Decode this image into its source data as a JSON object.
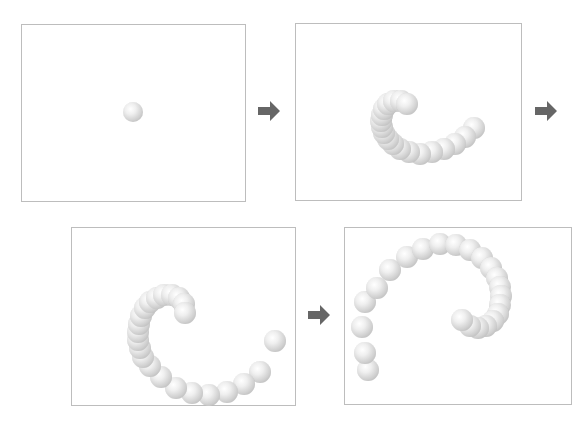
{
  "diagram": {
    "colors": {
      "panel_border": "#bdbdbd",
      "arrow": "#666666",
      "ball_light": "#ffffff",
      "ball_dark": "#a9a9a9"
    },
    "panels": [
      {
        "name": "frame-1",
        "x": 21,
        "y": 24,
        "w": 225,
        "h": 178,
        "balls": [
          [
            133,
            112,
            10
          ]
        ]
      },
      {
        "name": "frame-2",
        "x": 295,
        "y": 23,
        "w": 227,
        "h": 178,
        "balls": [
          [
            407,
            104,
            11
          ],
          [
            401,
            101,
            11
          ],
          [
            394,
            101,
            11
          ],
          [
            388,
            104,
            11
          ],
          [
            384,
            109,
            11
          ],
          [
            382,
            115,
            11
          ],
          [
            381,
            121,
            11
          ],
          [
            382,
            127,
            11
          ],
          [
            384,
            133,
            11
          ],
          [
            388,
            139,
            11
          ],
          [
            393,
            144,
            11
          ],
          [
            400,
            149,
            11
          ],
          [
            409,
            152,
            11
          ],
          [
            420,
            154,
            11
          ],
          [
            432,
            152,
            11
          ],
          [
            444,
            149,
            11
          ],
          [
            455,
            144,
            11
          ],
          [
            465,
            137,
            11
          ],
          [
            474,
            128,
            11
          ]
        ]
      },
      {
        "name": "frame-3",
        "x": 71,
        "y": 227,
        "w": 225,
        "h": 179,
        "balls": [
          [
            185,
            313,
            11
          ],
          [
            184,
            304,
            11
          ],
          [
            179,
            298,
            11
          ],
          [
            172,
            295,
            11
          ],
          [
            164,
            295,
            11
          ],
          [
            157,
            298,
            11
          ],
          [
            150,
            302,
            11
          ],
          [
            145,
            308,
            11
          ],
          [
            141,
            316,
            11
          ],
          [
            139,
            324,
            11
          ],
          [
            138,
            332,
            11
          ],
          [
            138,
            340,
            11
          ],
          [
            140,
            348,
            11
          ],
          [
            143,
            357,
            11
          ],
          [
            150,
            366,
            11
          ],
          [
            161,
            377,
            11
          ],
          [
            176,
            388,
            11
          ],
          [
            192,
            393,
            11
          ],
          [
            209,
            395,
            11
          ],
          [
            227,
            392,
            11
          ],
          [
            244,
            384,
            11
          ],
          [
            260,
            372,
            11
          ],
          [
            275,
            341,
            11
          ]
        ]
      },
      {
        "name": "frame-4",
        "x": 344,
        "y": 227,
        "w": 228,
        "h": 178,
        "balls": [
          [
            462,
            320,
            11
          ],
          [
            470,
            326,
            11
          ],
          [
            478,
            328,
            11
          ],
          [
            486,
            326,
            11
          ],
          [
            493,
            321,
            11
          ],
          [
            498,
            314,
            11
          ],
          [
            500,
            305,
            11
          ],
          [
            501,
            296,
            11
          ],
          [
            500,
            287,
            11
          ],
          [
            497,
            278,
            11
          ],
          [
            491,
            268,
            11
          ],
          [
            482,
            258,
            11
          ],
          [
            470,
            250,
            11
          ],
          [
            456,
            245,
            11
          ],
          [
            440,
            244,
            11
          ],
          [
            423,
            249,
            11
          ],
          [
            407,
            257,
            11
          ],
          [
            390,
            270,
            11
          ],
          [
            377,
            288,
            11
          ],
          [
            365,
            302,
            11
          ],
          [
            362,
            327,
            11
          ],
          [
            365,
            353,
            11
          ],
          [
            368,
            370,
            11
          ]
        ]
      }
    ],
    "arrows": [
      {
        "name": "arrow-1-to-2",
        "x": 258,
        "y": 101
      },
      {
        "name": "arrow-2-to-3",
        "x": 535,
        "y": 101
      },
      {
        "name": "arrow-3-to-4",
        "x": 308,
        "y": 305
      }
    ]
  }
}
